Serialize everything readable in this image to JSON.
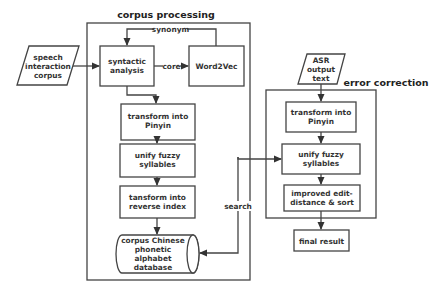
{
  "diagram": {
    "groups": {
      "corpus_processing": {
        "title": "corpus processing"
      },
      "error_correction": {
        "title": "error correction"
      }
    },
    "nodes": {
      "speech_corpus": {
        "lines": [
          "speech",
          "interaction",
          "corpus"
        ],
        "shape": "parallelogram"
      },
      "syntactic_analysis": {
        "lines": [
          "syntactic",
          "analysis"
        ],
        "shape": "rectangle"
      },
      "word2vec": {
        "lines": [
          "Word2Vec"
        ],
        "shape": "rectangle"
      },
      "cp_transform_pinyin": {
        "lines": [
          "transform into",
          "Pinyin"
        ],
        "shape": "rectangle"
      },
      "cp_unify_fuzzy": {
        "lines": [
          "unify fuzzy",
          "syllables"
        ],
        "shape": "rectangle"
      },
      "cp_reverse_index": {
        "lines": [
          "tansform into",
          "reverse index"
        ],
        "shape": "rectangle"
      },
      "database": {
        "lines": [
          "corpus Chinese",
          "phonetic",
          "alphabet",
          "database"
        ],
        "shape": "cylinder"
      },
      "asr_text": {
        "lines": [
          "ASR",
          "output",
          "text"
        ],
        "shape": "parallelogram"
      },
      "ec_transform_pinyin": {
        "lines": [
          "transform into",
          "Pinyin"
        ],
        "shape": "rectangle"
      },
      "ec_unify_fuzzy": {
        "lines": [
          "unify fuzzy",
          "syllables"
        ],
        "shape": "rectangle"
      },
      "edit_distance": {
        "lines": [
          "improved edit-",
          "distance & sort"
        ],
        "shape": "rectangle"
      },
      "final_result": {
        "lines": [
          "final result"
        ],
        "shape": "rectangle"
      }
    },
    "edge_labels": {
      "synonym": "synonym",
      "core": "core",
      "search": "search"
    },
    "edges": [
      {
        "from": "speech_corpus",
        "to": "syntactic_analysis"
      },
      {
        "from": "syntactic_analysis",
        "to": "word2vec",
        "label": "core"
      },
      {
        "from": "word2vec",
        "to": "syntactic_analysis",
        "label": "synonym"
      },
      {
        "from": "syntactic_analysis",
        "to": "cp_transform_pinyin"
      },
      {
        "from": "cp_transform_pinyin",
        "to": "cp_unify_fuzzy"
      },
      {
        "from": "cp_unify_fuzzy",
        "to": "cp_reverse_index"
      },
      {
        "from": "cp_reverse_index",
        "to": "database"
      },
      {
        "from": "database",
        "to": "ec_unify_fuzzy",
        "label": "search",
        "bidirectional": true
      },
      {
        "from": "asr_text",
        "to": "ec_transform_pinyin"
      },
      {
        "from": "ec_transform_pinyin",
        "to": "ec_unify_fuzzy"
      },
      {
        "from": "ec_unify_fuzzy",
        "to": "edit_distance"
      },
      {
        "from": "edit_distance",
        "to": "final_result"
      }
    ],
    "colors": {
      "stroke": "#444444",
      "text": "#333333",
      "background": "#ffffff"
    }
  }
}
